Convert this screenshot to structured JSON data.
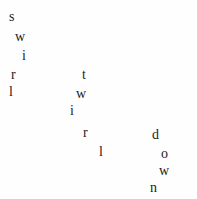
{
  "canvas": {
    "width": 197,
    "height": 199,
    "background_color": "#fefefe",
    "text_color": "#1c1c1c"
  },
  "poem": {
    "full_text": "swirl twirl down",
    "words": [
      {
        "id": "word-swirl",
        "text": "swirl",
        "letters": [
          {
            "char": "s",
            "x": 9,
            "y": 10,
            "size": 14
          },
          {
            "char": "w",
            "x": 15,
            "y": 30,
            "size": 14
          },
          {
            "char": "i",
            "x": 22,
            "y": 49,
            "size": 14
          },
          {
            "char": "r",
            "x": 11,
            "y": 68,
            "size": 14
          },
          {
            "char": "l",
            "x": 9,
            "y": 85,
            "size": 14
          }
        ]
      },
      {
        "id": "word-twirl",
        "text": "twirl",
        "letters": [
          {
            "char": "t",
            "x": 82,
            "y": 68,
            "size": 14
          },
          {
            "char": "w",
            "x": 76,
            "y": 87,
            "size": 14
          },
          {
            "char": "i",
            "x": 70,
            "y": 104,
            "size": 14
          },
          {
            "char": "r",
            "x": 83,
            "y": 126,
            "size": 14
          },
          {
            "char": "l",
            "x": 99,
            "y": 145,
            "size": 14
          }
        ]
      },
      {
        "id": "word-down",
        "text": "down",
        "letters": [
          {
            "char": "d",
            "x": 152,
            "y": 128,
            "size": 14
          },
          {
            "char": "o",
            "x": 161,
            "y": 147,
            "size": 14
          },
          {
            "char": "w",
            "x": 159,
            "y": 164,
            "size": 14
          },
          {
            "char": "n",
            "x": 150,
            "y": 181,
            "size": 14
          }
        ]
      }
    ]
  }
}
